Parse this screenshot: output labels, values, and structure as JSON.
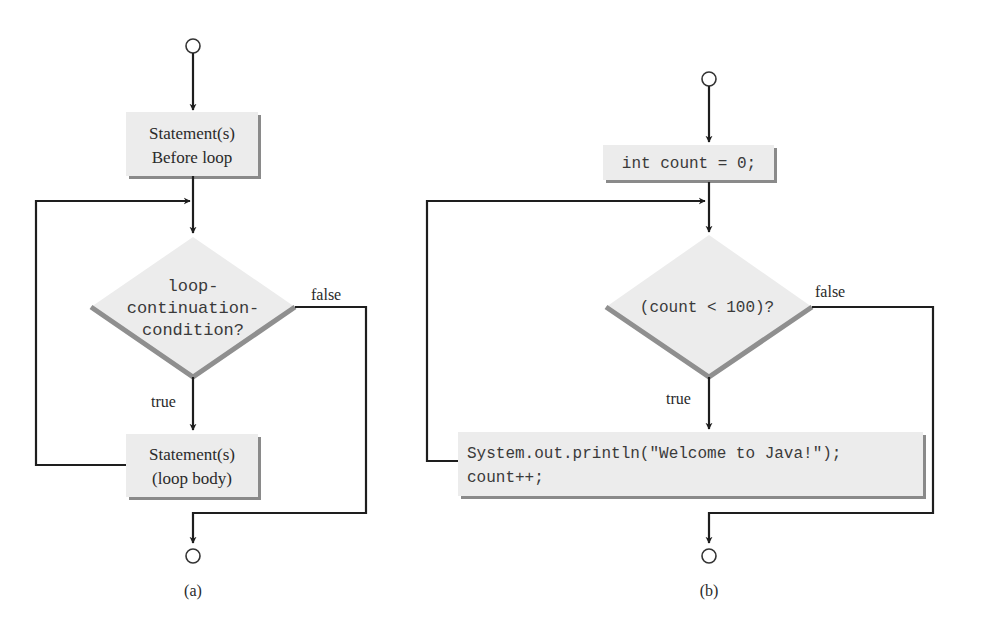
{
  "figure": {
    "panels": [
      {
        "id": "a",
        "caption": "(a)",
        "start_box": {
          "lines": [
            "Statement(s)",
            "Before loop"
          ]
        },
        "decision": {
          "lines": [
            "loop-",
            "continuation-",
            "condition?"
          ]
        },
        "true_label": "true",
        "false_label": "false",
        "body_box": {
          "lines": [
            "Statement(s)",
            "(loop body)"
          ]
        }
      },
      {
        "id": "b",
        "caption": "(b)",
        "start_box": {
          "lines": [
            "int count = 0;"
          ]
        },
        "decision": {
          "lines": [
            "(count < 100)?"
          ]
        },
        "true_label": "true",
        "false_label": "false",
        "body_box": {
          "lines": [
            "System.out.println(\"Welcome to Java!\");",
            "count++;"
          ]
        }
      }
    ]
  },
  "colors": {
    "line": "#1e1e1e",
    "box_fill": "#ececec",
    "box_shadow": "#8a8a8a",
    "text": "#2a2a2a"
  }
}
